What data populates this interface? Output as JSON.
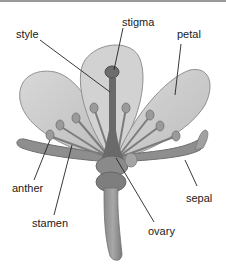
{
  "diagram": {
    "labels": {
      "style": "style",
      "stigma": "stigma",
      "petal": "petal",
      "anther": "anther",
      "stamen": "stamen",
      "sepal": "sepal",
      "ovary": "ovary"
    },
    "colors": {
      "petal_fill": "#cfcfcf",
      "petal_edge": "#8c8c8c",
      "dark_part": "#6e6e6e",
      "leader_line": "#222222",
      "text": "#1a1a1a"
    }
  }
}
